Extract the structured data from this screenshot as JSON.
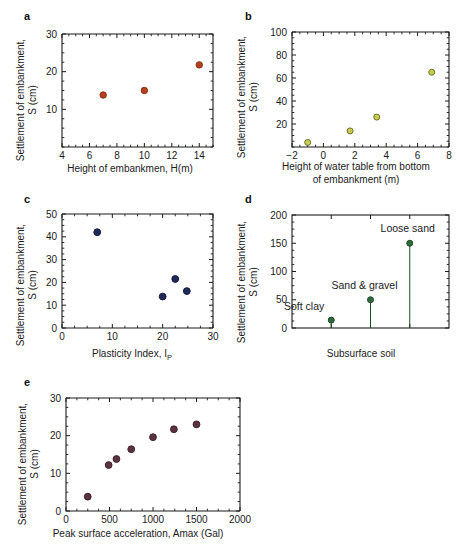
{
  "figure": {
    "panels": [
      "a",
      "b",
      "c",
      "d",
      "e"
    ],
    "shared_ylabel_line1": "Settlement of embankment,",
    "shared_ylabel_line2": "S (cm)"
  },
  "chart_data": [
    {
      "type": "scatter",
      "panel": "a",
      "title": "",
      "xlabel": "Height of embankmen, H(m)",
      "ylabel": "Settlement of embankment, S (cm)",
      "xlim": [
        4,
        15
      ],
      "ylim": [
        0,
        30
      ],
      "xticks": [
        4,
        6,
        8,
        10,
        12,
        14
      ],
      "xticklabels": [
        "4",
        "6",
        "8",
        "10",
        "12",
        "14"
      ],
      "yticks": [
        10,
        20,
        30
      ],
      "yticklabels": [
        "10",
        "20",
        "30"
      ],
      "grid": false,
      "legend": "none",
      "marker_color": "#b5401f",
      "marker_edge": "#8c2f12",
      "x": [
        7.0,
        10.0,
        14.0
      ],
      "y": [
        13.8,
        15.0,
        21.8
      ]
    },
    {
      "type": "scatter",
      "panel": "b",
      "title": "",
      "xlabel": "Height of water table from bottom of embankment (m)",
      "xlabel_line1": "Height of water table from bottom",
      "xlabel_line2": "of embankment (m)",
      "ylabel": "Settlement of embankment, S (cm)",
      "xlim": [
        -2,
        8
      ],
      "ylim": [
        0,
        100
      ],
      "xticks": [
        -2,
        0,
        2,
        4,
        6,
        8
      ],
      "xticklabels": [
        "−2",
        "0",
        "2",
        "4",
        "6",
        "8"
      ],
      "yticks": [
        20,
        40,
        60,
        80,
        100
      ],
      "yticklabels": [
        "20",
        "40",
        "60",
        "80",
        "100"
      ],
      "grid": false,
      "legend": "none",
      "marker_color": "#c8cc55",
      "marker_edge": "#6e7320",
      "x": [
        -1.0,
        1.7,
        3.4,
        6.9
      ],
      "y": [
        4.0,
        14.0,
        26.0,
        65.0
      ]
    },
    {
      "type": "scatter",
      "panel": "c",
      "title": "",
      "xlabel": "Plasticity Index, IP",
      "xlabel_main": "Plasticity Index, I",
      "xlabel_sub": "P",
      "ylabel": "Settlement of embankment, S (cm)",
      "xlim": [
        0,
        30
      ],
      "ylim": [
        0,
        50
      ],
      "xticks": [
        0,
        10,
        20,
        30
      ],
      "xticklabels": [
        "0",
        "10",
        "20",
        "30"
      ],
      "yticks": [
        0,
        10,
        20,
        30,
        40,
        50
      ],
      "yticklabels": [
        "0",
        "10",
        "20",
        "30",
        "40",
        "50"
      ],
      "grid": false,
      "legend": "none",
      "marker_color": "#1f2a5a",
      "marker_edge": "#141c3e",
      "x": [
        7.0,
        20.0,
        22.5,
        24.8
      ],
      "y": [
        42.0,
        13.8,
        21.5,
        16.2
      ]
    },
    {
      "type": "scatter",
      "panel": "d",
      "title": "",
      "xlabel": "Subsurface soil",
      "ylabel": "Settlement of embankment, S (cm)",
      "xlim": [
        0,
        4
      ],
      "ylim": [
        0,
        200
      ],
      "xticks": [
        1,
        2,
        3
      ],
      "xticklabels": [
        "",
        "",
        ""
      ],
      "yticks": [
        0,
        50,
        100,
        150,
        200
      ],
      "yticklabels": [
        "0",
        "50",
        "100",
        "150",
        "200"
      ],
      "grid": false,
      "legend": "none",
      "marker_color": "#2f6b3a",
      "marker_edge": "#1d4726",
      "categories": [
        "Soft clay",
        "Sand & gravel",
        "Loose sand"
      ],
      "x": [
        1,
        2,
        3
      ],
      "y": [
        14,
        50,
        150
      ],
      "annotations": [
        {
          "text": "Soft clay",
          "x": 1,
          "y": 14
        },
        {
          "text": "Sand & gravel",
          "x": 2,
          "y": 50
        },
        {
          "text": "Loose sand",
          "x": 3,
          "y": 150
        }
      ]
    },
    {
      "type": "scatter",
      "panel": "e",
      "title": "",
      "xlabel": "Peak surface acceleration, Amax (Gal)",
      "ylabel": "Settlement of embankment, S (cm)",
      "xlim": [
        0,
        2000
      ],
      "ylim": [
        0,
        30
      ],
      "xticks": [
        0,
        500,
        1000,
        1500,
        2000
      ],
      "xticklabels": [
        "0",
        "500",
        "1000",
        "1500",
        "2000"
      ],
      "yticks": [
        0,
        10,
        20,
        30
      ],
      "yticklabels": [
        "0",
        "10",
        "20",
        "30"
      ],
      "grid": false,
      "legend": "none",
      "marker_color": "#5c3340",
      "marker_edge": "#40222c",
      "x": [
        250,
        490,
        580,
        750,
        1000,
        1240,
        1500
      ],
      "y": [
        3.8,
        12.2,
        13.8,
        16.4,
        19.6,
        21.7,
        23.0
      ]
    }
  ]
}
